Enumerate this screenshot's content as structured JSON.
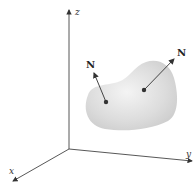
{
  "diagram": {
    "axes": {
      "x_label": "x",
      "y_label": "y",
      "z_label": "z"
    },
    "surface": {
      "fill": "#d8d8d8",
      "edge": "#e6e6e6"
    },
    "normals": [
      {
        "label": "N",
        "point": [
          106,
          102
        ],
        "tip": [
          93,
          72
        ]
      },
      {
        "label": "N",
        "point": [
          144,
          90
        ],
        "tip": [
          175,
          58
        ]
      }
    ],
    "colors": {
      "axis": "#444444",
      "vector": "#444444"
    }
  }
}
